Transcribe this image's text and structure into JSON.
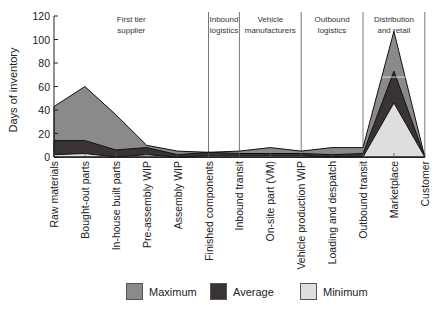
{
  "chart_data": {
    "type": "area",
    "title": "",
    "xlabel": "",
    "ylabel": "Days of inventory",
    "ylim": [
      0,
      120
    ],
    "yticks": [
      0,
      20,
      40,
      60,
      80,
      100,
      120
    ],
    "grid": false,
    "legend_position": "bottom",
    "categories": [
      "Raw materials",
      "Bought-out parts",
      "In-house built parts",
      "Pre-assembly WIP",
      "Assembly WIP",
      "Finished components",
      "Inbound transit",
      "On-site part (VM)",
      "Vehicle production WIP",
      "Loading and despatch",
      "Outbound transit",
      "Marketplace",
      "Customer"
    ],
    "series": [
      {
        "name": "Maximum",
        "color": "#8a8a8a",
        "values": [
          43,
          60,
          36,
          10,
          5,
          4,
          5,
          8,
          5,
          8,
          8,
          107,
          0
        ]
      },
      {
        "name": "Average",
        "color": "#3a3334",
        "values": [
          14,
          14,
          6,
          8,
          2,
          4,
          3,
          3,
          3,
          2,
          3,
          73,
          0
        ]
      },
      {
        "name": "Minimum",
        "color": "#dedede",
        "values": [
          2,
          3,
          0,
          2,
          0,
          1,
          1,
          1,
          1,
          0,
          0,
          46,
          0
        ]
      }
    ],
    "stages": [
      {
        "label": [
          "First tier",
          "supplier"
        ],
        "from": 0,
        "to": 5
      },
      {
        "label": [
          "Inbound",
          "logistics"
        ],
        "from": 5,
        "to": 6
      },
      {
        "label": [
          "Vehicle",
          "manufacturers"
        ],
        "from": 6,
        "to": 8
      },
      {
        "label": [
          "Outbound",
          "logistics"
        ],
        "from": 8,
        "to": 10
      },
      {
        "label": [
          "Distribution",
          "and retail"
        ],
        "from": 10,
        "to": 12
      }
    ]
  },
  "legend": {
    "items": [
      {
        "label": "Maximum",
        "color": "#8a8a8a"
      },
      {
        "label": "Average",
        "color": "#3a3334"
      },
      {
        "label": "Minimum",
        "color": "#dedede"
      }
    ]
  }
}
